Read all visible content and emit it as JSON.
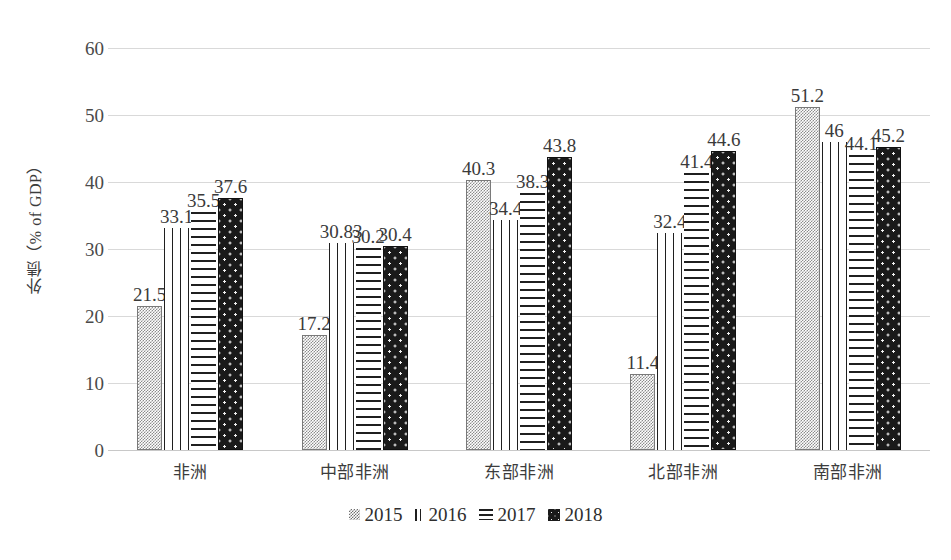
{
  "chart_data": {
    "type": "bar",
    "title": "",
    "subtitle": "",
    "xlabel": "",
    "ylabel": "外债（% of GDP）",
    "ylim": [
      0,
      60
    ],
    "yticks": [
      0,
      10,
      20,
      30,
      40,
      50,
      60
    ],
    "ytick_labels": [
      "0",
      "10",
      "20",
      "30",
      "40",
      "50",
      "60"
    ],
    "grid": true,
    "legend_position": "bottom",
    "categories": [
      "非洲",
      "中部非洲",
      "东部非洲",
      "北部非洲",
      "南部非洲"
    ],
    "series": [
      {
        "name": "2015",
        "pattern": "checker-gray",
        "values": [
          21.5,
          17.2,
          40.3,
          11.4,
          51.2
        ],
        "labels": [
          "21.5",
          "17.2",
          "40.3",
          "11.4",
          "51.2"
        ]
      },
      {
        "name": "2016",
        "pattern": "vertical-lines",
        "values": [
          33.1,
          30.83,
          34.4,
          32.4,
          46
        ],
        "labels": [
          "33.1",
          "30.83",
          "34.4",
          "32.4",
          "46"
        ]
      },
      {
        "name": "2017",
        "pattern": "horizontal-lines",
        "values": [
          35.5,
          30.2,
          38.3,
          41.4,
          44.1
        ],
        "labels": [
          "35.5",
          "30.2",
          "38.3",
          "41.4",
          "44.1"
        ]
      },
      {
        "name": "2018",
        "pattern": "dark-dots",
        "values": [
          37.6,
          30.4,
          43.8,
          44.6,
          45.2
        ],
        "labels": [
          "37.6",
          "30.4",
          "43.8",
          "44.6",
          "45.2"
        ]
      }
    ]
  },
  "legend": {
    "items": [
      {
        "label": "2015",
        "swatch": "checker-gray-swatch"
      },
      {
        "label": "2016",
        "swatch": "vertical-lines-swatch"
      },
      {
        "label": "2017",
        "swatch": "horizontal-lines-swatch"
      },
      {
        "label": "2018",
        "swatch": "dark-dots-swatch"
      }
    ]
  },
  "colors": {
    "grid": "#d9d9d9",
    "text": "#3a3a3a",
    "series_2015": "#8c8c8c",
    "series_2016": "#1f1f1f",
    "series_2017": "#1f1f1f",
    "series_2018": "#1a1a1a",
    "background": "#ffffff"
  }
}
